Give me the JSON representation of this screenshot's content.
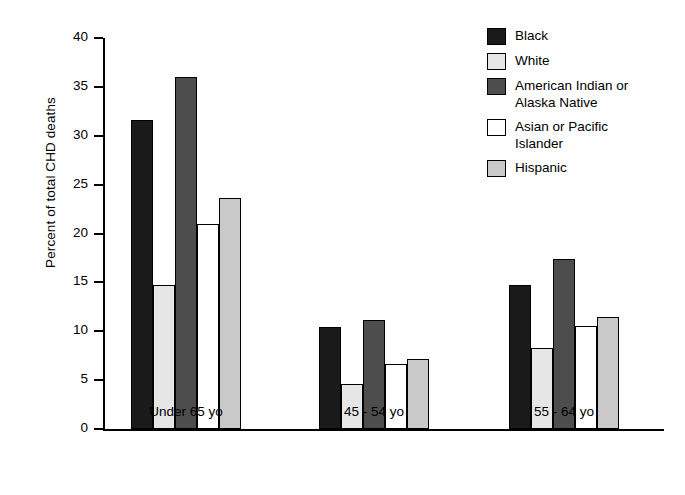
{
  "chart_data": {
    "type": "bar",
    "title": "",
    "xlabel": "",
    "ylabel": "Percent of total CHD deaths",
    "ylim": [
      0,
      40
    ],
    "yticks": [
      0,
      5,
      10,
      15,
      20,
      25,
      30,
      35,
      40
    ],
    "ytick_labels": [
      "0",
      "5",
      "10",
      "15",
      "20",
      "25",
      "30",
      "35",
      "40"
    ],
    "grid": false,
    "legend_position": "top-right",
    "categories": [
      "Under 65 yo",
      "45 - 54 yo",
      "55 - 64 yo"
    ],
    "series": [
      {
        "name": "Black",
        "color": "#1a1a1a",
        "values": [
          31.6,
          10.4,
          14.7
        ]
      },
      {
        "name": "White",
        "color": "#e6e6e6",
        "values": [
          14.7,
          4.6,
          8.3
        ]
      },
      {
        "name": "American Indian or\nAlaska Native",
        "color": "#4d4d4d",
        "values": [
          36.0,
          11.2,
          17.4
        ]
      },
      {
        "name": "Asian or Pacific\nIslander",
        "color": "#ffffff",
        "values": [
          21.0,
          6.7,
          10.5
        ]
      },
      {
        "name": "Hispanic",
        "color": "#c9c9c9",
        "values": [
          23.6,
          7.2,
          11.5
        ]
      }
    ]
  }
}
